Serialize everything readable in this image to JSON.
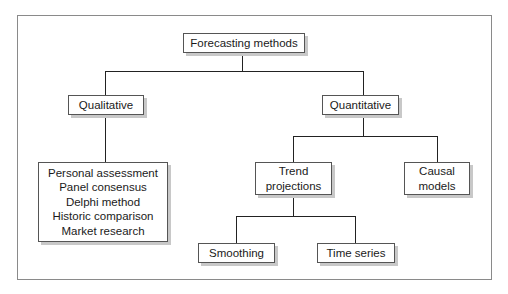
{
  "diagram": {
    "root": {
      "label": "Forecasting methods"
    },
    "qualitative": {
      "label": "Qualitative",
      "methods": [
        "Personal assessment",
        "Panel consensus",
        "Delphi method",
        "Historic comparison",
        "Market research"
      ]
    },
    "quantitative": {
      "label": "Quantitative",
      "trend": {
        "lines": [
          "Trend",
          "projections"
        ],
        "children": [
          "Smoothing",
          "Time series"
        ]
      },
      "causal": {
        "lines": [
          "Causal",
          "models"
        ]
      }
    }
  }
}
